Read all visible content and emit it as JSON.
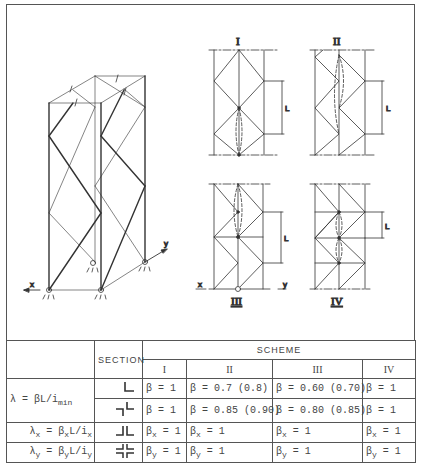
{
  "figure": {
    "schemes": [
      {
        "id": "I",
        "label": "I"
      },
      {
        "id": "II",
        "label": "II"
      },
      {
        "id": "III",
        "label": "III"
      },
      {
        "id": "IV",
        "label": "IV"
      }
    ],
    "length_label": "L",
    "axis_x": "x",
    "axis_y": "y"
  },
  "table": {
    "header": {
      "section": "SECTION",
      "scheme": "SCHEME",
      "columns": [
        "I",
        "II",
        "III",
        "IV"
      ]
    },
    "rows": [
      {
        "formula": "λ = βL/i",
        "formula_sub": "min",
        "section_icon": "single-angle-section",
        "values": [
          "β = 1",
          "β = 0.7 (0.8)",
          "β = 0.60 (0.70)",
          "β = 1"
        ]
      },
      {
        "section_icon": "double-angle-offset-section",
        "values": [
          "β = 1",
          "β = 0.85 (0.90)",
          "β = 0.80 (0.85)",
          "β = 1"
        ]
      },
      {
        "formula_x": {
          "lambda": "λ",
          "lambda_sub": "x",
          "eq": " = β",
          "beta_sub": "x",
          "rest": "L/i",
          "i_sub": "x"
        },
        "section_icon": "double-angle-back-to-back-section",
        "values": [
          {
            "base": "β",
            "sub": "x",
            "rest": " = 1"
          },
          {
            "base": "β",
            "sub": "x",
            "rest": " = 1"
          },
          {
            "base": "β",
            "sub": "x",
            "rest": " = 1"
          },
          {
            "base": "β",
            "sub": "x",
            "rest": " = 1"
          }
        ]
      },
      {
        "formula_y": {
          "lambda": "λ",
          "lambda_sub": "y",
          "eq": " = β",
          "beta_sub": "y",
          "rest": "L/i",
          "i_sub": "y"
        },
        "section_icon": "cruciform-angle-section",
        "values": [
          {
            "base": "β",
            "sub": "y",
            "rest": " = 1"
          },
          {
            "base": "β",
            "sub": "y",
            "rest": " = 1"
          },
          {
            "base": "β",
            "sub": "y",
            "rest": " = 1"
          },
          {
            "base": "β",
            "sub": "y",
            "rest": " = 1"
          }
        ]
      }
    ]
  }
}
